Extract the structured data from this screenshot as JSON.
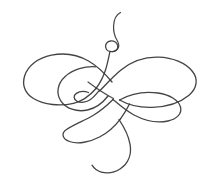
{
  "artwork": {
    "title": "Calligraphic Flourish Ornament",
    "type": "line-drawing",
    "subject": "decorative swirl flourish with interlaced loops",
    "canvas": {
      "width": 216,
      "height": 192,
      "background_color": "#ffffff"
    },
    "stroke": {
      "color": "#3a3a3c",
      "width": 1.35,
      "opacity": 0.95,
      "cap": "round",
      "join": "round"
    },
    "bounds": {
      "left": 23,
      "right": 196,
      "top": 12,
      "bottom": 174
    },
    "elements": [
      {
        "name": "upper-tail",
        "description": "thin tail rising from small top loop, curving up and slightly right then hooking left at the very top",
        "start_point": [
          120,
          12
        ],
        "end_point": [
          112,
          44
        ]
      },
      {
        "name": "small-top-loop",
        "description": "tiny circular eyelet below the tail",
        "center": [
          112,
          50
        ],
        "radius": 6
      },
      {
        "name": "upper-left-loop",
        "description": "large elongated oval sweeping left from center",
        "bbox": [
          23,
          54,
          112,
          104
        ]
      },
      {
        "name": "inner-left-loop",
        "description": "medium tilted oval nested inside the upper-left loop",
        "bbox": [
          57,
          66,
          98,
          112
        ]
      },
      {
        "name": "tiny-center-eyelet",
        "description": "very small loop near the middle-left",
        "center": [
          79,
          98
        ],
        "radius": 5
      },
      {
        "name": "upper-right-loop",
        "description": "large elongated oval sweeping right from center",
        "bbox": [
          110,
          57,
          196,
          108
        ]
      },
      {
        "name": "lower-right-loop",
        "description": "medium oval below the upper-right loop, pointing left",
        "bbox": [
          124,
          92,
          181,
          122
        ]
      },
      {
        "name": "lower-left-pointed-loop",
        "description": "narrow pointed loop extending to the lower left",
        "bbox": [
          64,
          116,
          120,
          145
        ]
      },
      {
        "name": "bottom-hook",
        "description": "large descending hook curving down, right, around and terminating to the left",
        "start_point": [
          120,
          120
        ],
        "end_point": [
          95,
          171
        ]
      },
      {
        "name": "center-crossings",
        "description": "diamond formed by four strand crossings at the middle of the composition",
        "crossing_points": [
          [
            108,
            78
          ],
          [
            124,
            96
          ],
          [
            104,
            114
          ],
          [
            88,
            96
          ]
        ]
      }
    ]
  }
}
